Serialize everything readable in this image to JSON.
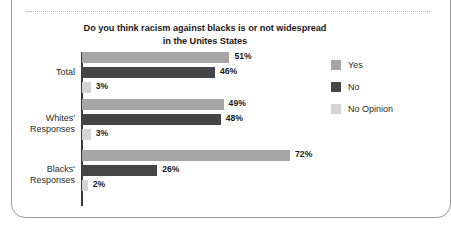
{
  "chart_data": {
    "type": "bar",
    "orientation": "horizontal",
    "title": "Do you think racism against blacks is or not widespread in the Unites States",
    "title_line1": "Do you think racism against blacks is or not widespread",
    "title_line2": "in the Unites States",
    "xlabel": "",
    "ylabel": "",
    "xlim": [
      0,
      80
    ],
    "grid": false,
    "unit": "%",
    "legend_position": "right",
    "categories": [
      "Total",
      "Whites' Responses",
      "Blacks' Responses"
    ],
    "series": [
      {
        "name": "Yes",
        "color": "#a6a6a6",
        "values": [
          51,
          49,
          72
        ],
        "labels": [
          "51%",
          "49%",
          "72%"
        ]
      },
      {
        "name": "No",
        "color": "#454545",
        "values": [
          46,
          48,
          26
        ],
        "labels": [
          "46%",
          "48%",
          "26%"
        ]
      },
      {
        "name": "No Opinion",
        "color": "#d4d4d4",
        "values": [
          3,
          3,
          2
        ],
        "labels": [
          "3%",
          "3%",
          "2%"
        ]
      }
    ],
    "groups": [
      {
        "category": "Total",
        "category_line1": "Total",
        "category_line2": "",
        "bars": [
          {
            "series": "Yes",
            "value": 51,
            "label": "51%",
            "color": "#a6a6a6"
          },
          {
            "series": "No",
            "value": 46,
            "label": "46%",
            "color": "#454545"
          },
          {
            "series": "No Opinion",
            "value": 3,
            "label": "3%",
            "color": "#d4d4d4"
          }
        ]
      },
      {
        "category": "Whites' Responses",
        "category_line1": "Whites'",
        "category_line2": "Responses",
        "bars": [
          {
            "series": "Yes",
            "value": 49,
            "label": "49%",
            "color": "#a6a6a6"
          },
          {
            "series": "No",
            "value": 48,
            "label": "48%",
            "color": "#454545"
          },
          {
            "series": "No Opinion",
            "value": 3,
            "label": "3%",
            "color": "#d4d4d4"
          }
        ]
      },
      {
        "category": "Blacks' Responses",
        "category_line1": "Blacks'",
        "category_line2": "Responses",
        "bars": [
          {
            "series": "Yes",
            "value": 72,
            "label": "72%",
            "color": "#a6a6a6"
          },
          {
            "series": "No",
            "value": 26,
            "label": "26%",
            "color": "#454545"
          },
          {
            "series": "No Opinion",
            "value": 2,
            "label": "2%",
            "color": "#d4d4d4"
          }
        ]
      }
    ],
    "legend": [
      {
        "label": "Yes",
        "color": "#a6a6a6"
      },
      {
        "label": "No",
        "color": "#454545"
      },
      {
        "label": "No Opinion",
        "color": "#d4d4d4"
      }
    ],
    "colors": {
      "yes": "#a6a6a6",
      "no": "#454545",
      "no_opinion": "#d4d4d4",
      "axis": "#3a3a3a",
      "text": "#1b1b1b",
      "frame": "#9a9a9a"
    }
  }
}
